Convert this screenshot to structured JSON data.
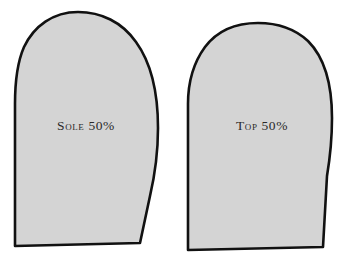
{
  "diagram": {
    "background_color": "#ffffff",
    "canvas": {
      "width": 343,
      "height": 266
    },
    "style": {
      "fill_color": "#d4d4d4",
      "outline_color": "#111111",
      "outline_width": 2.6,
      "label_color": "#2a2a2a",
      "texture": "faint-vertical-lines"
    },
    "pieces": [
      {
        "id": "sole",
        "label": "Sole 50%",
        "label_x": 86,
        "label_y": 127,
        "outline_path": "M 78 12 C 53 12 34 26 24 47 C 17 63 15 82 15 104 L 15 246 L 140 243 L 150 196 C 156 170 158 150 158 128 C 158 94 152 64 136 42 C 122 22 101 12 78 12 Z"
      },
      {
        "id": "top",
        "label": "Top 50%",
        "label_x": 262,
        "label_y": 127,
        "outline_path": "M 258 23 C 236 23 217 31 205 47 C 194 62 188 82 188 104 L 188 250 L 323 247 L 327 176 C 331 152 332 134 332 118 C 332 86 325 58 308 41 C 295 29 277 23 258 23 Z"
      }
    ]
  }
}
